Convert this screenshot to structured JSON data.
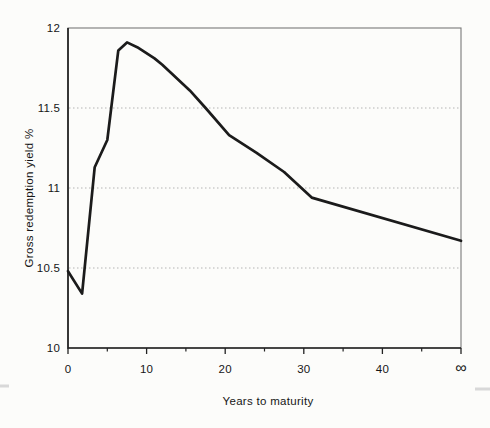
{
  "figure": {
    "background": "#fcfcfa",
    "line_color": "#1b1b1b",
    "frame_color": "#787878",
    "axis_color": "#222222",
    "grid_color": "#b4b4b4",
    "text_color": "#161616"
  },
  "chart_data": {
    "type": "line",
    "title": "",
    "xlabel": "Years to maturity",
    "ylabel": "Gross redemption yield %",
    "xlim": [
      0,
      50
    ],
    "ylim": [
      10,
      12
    ],
    "x_ticks": {
      "values": [
        0,
        10,
        20,
        30,
        40,
        50
      ],
      "labels": [
        "0",
        "10",
        "20",
        "30",
        "40",
        "∞"
      ]
    },
    "x_minor_ticks": [
      5,
      15,
      25,
      35,
      45
    ],
    "y_ticks": {
      "values": [
        10,
        10.5,
        11,
        11.5,
        12
      ],
      "labels": [
        "10",
        "10.5",
        "11",
        "11.5",
        "12"
      ]
    },
    "gridlines_y": [
      10.5,
      11,
      11.5
    ],
    "grid_style": "dotted horizontal",
    "legend": "none",
    "series": [
      {
        "name": "Gross redemption yield",
        "points": [
          [
            0,
            10.48
          ],
          [
            1.8,
            10.34
          ],
          [
            3.4,
            11.13
          ],
          [
            5,
            11.3
          ],
          [
            6.4,
            11.86
          ],
          [
            7.5,
            11.91
          ],
          [
            8.8,
            11.88
          ],
          [
            11,
            11.81
          ],
          [
            12,
            11.77
          ],
          [
            15.5,
            11.61
          ],
          [
            17.5,
            11.5
          ],
          [
            20.5,
            11.33
          ],
          [
            24,
            11.22
          ],
          [
            27.5,
            11.1
          ],
          [
            31,
            10.94
          ],
          [
            50,
            10.67
          ]
        ]
      }
    ]
  }
}
